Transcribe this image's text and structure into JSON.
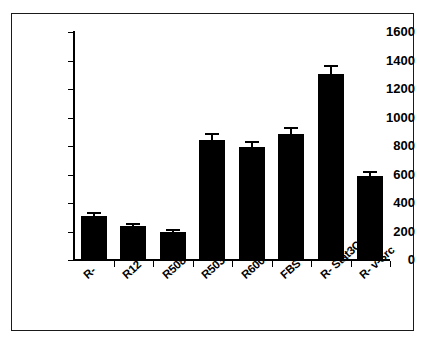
{
  "figure": {
    "frame_color": "#1a1a1a",
    "bar_color": "#000000",
    "background": "#ffffff"
  },
  "chart_data": {
    "type": "bar",
    "title": "",
    "subtitle": "",
    "xlabel": "",
    "ylabel": "",
    "categories": [
      "R-",
      "R12",
      "R508",
      "R503",
      "R600",
      "FBS",
      "R- Stat3C",
      "R- v-Src"
    ],
    "values": [
      310,
      240,
      198,
      842,
      795,
      885,
      1303,
      590
    ],
    "errors": [
      12,
      8,
      6,
      32,
      28,
      32,
      50,
      18
    ],
    "ylim": [
      0,
      1600
    ],
    "yticks": [
      0,
      200,
      400,
      600,
      800,
      1000,
      1200,
      1400,
      1600
    ],
    "ytick_labels": [
      "0",
      "200",
      "400",
      "600",
      "800",
      "1000",
      "1200",
      "1400",
      "1600"
    ],
    "grid": false,
    "legend": false,
    "legend_position": "none",
    "error_bar_style": "symmetric-caps",
    "orientation": "vertical",
    "xtick_label_rotation": -42
  }
}
